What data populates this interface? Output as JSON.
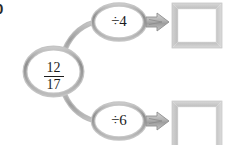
{
  "problem": {
    "number_visible": "0"
  },
  "diagram": {
    "type": "function-machine",
    "input": {
      "label": "12/17",
      "numerator": "12",
      "denominator": "17"
    },
    "branches": [
      {
        "operation_label": "÷4",
        "operation_symbol": "÷",
        "operand": "4",
        "output_value": ""
      },
      {
        "operation_label": "÷6",
        "operation_symbol": "÷",
        "operand": "6",
        "output_value": ""
      }
    ]
  },
  "colors": {
    "background": "#ffffff",
    "node_stroke": "#9a9a9a",
    "node_stroke_light": "#cfcfcf",
    "node_fill": "#ffffff",
    "connector": "#a8a8a8",
    "arrow_fill": "#b5b5b5",
    "arrow_stroke": "#8f8f8f",
    "box_border": "#c9c9c9",
    "box_border_dark": "#a9a9a9",
    "text": "#1c1c1c"
  }
}
